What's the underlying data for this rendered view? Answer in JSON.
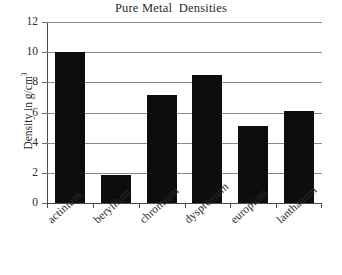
{
  "chart_data": {
    "type": "bar",
    "title": "Pure Metal  Densities",
    "xlabel": "",
    "ylabel": "Density in g/cm",
    "ylabel_superscript": "3",
    "categories": [
      "actinium",
      "beryllium",
      "chromium",
      "dysprosium",
      "europium",
      "lanthanum"
    ],
    "values": [
      10.0,
      1.85,
      7.15,
      8.5,
      5.1,
      6.1
    ],
    "ylim": [
      0,
      12
    ],
    "ytick_labels": [
      "0",
      "2",
      "4",
      "6",
      "8",
      "10",
      "12"
    ],
    "ytick_values": [
      0,
      2,
      4,
      6,
      8,
      10,
      12
    ],
    "grid": true,
    "legend": false,
    "bar_color": "#0d0d0d",
    "gridline_color": "#8a8a8a",
    "axis_color": "#4a4a4a",
    "background": "#ffffff"
  }
}
